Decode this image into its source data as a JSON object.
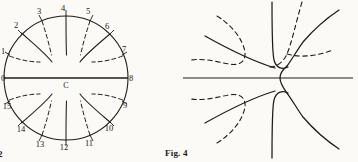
{
  "page": {
    "background_color": "#fbfaf6",
    "ink_color": "#1c1c1a",
    "width": 358,
    "height": 162
  },
  "figures": [
    {
      "id": "fig2",
      "caption": ". 2",
      "caption_full": "Fig. 2",
      "center_label": "C",
      "geometry": {
        "cx": 66,
        "cy": 78,
        "r": 62,
        "diameter_line": {
          "x1": 4,
          "y1": 78,
          "x2": 128,
          "y2": 78
        }
      },
      "boundary_labels": [
        "0",
        "1",
        "2",
        "3",
        "4",
        "5",
        "6",
        "7",
        "8",
        "9",
        "10",
        "11",
        "12",
        "13",
        "14",
        "15"
      ],
      "description": "Circle with 16 numbered boundary stations, horizontal diameter through centre C, alternating solid and dashed interior arcs forming a flow/field pattern."
    },
    {
      "id": "fig4",
      "caption": "Fig. 4",
      "geometry": {
        "axis_line": {
          "x1": 8,
          "y1": 78,
          "x2": 178,
          "y2": 78
        }
      },
      "description": "Saddle-point field diagram: solid streamline curves and dashed equipotential curves radiating about a central critical point, with a horizontal axis line."
    }
  ],
  "legend": {
    "solid_meaning": "solid curve",
    "dashed_meaning": "dashed curve"
  }
}
